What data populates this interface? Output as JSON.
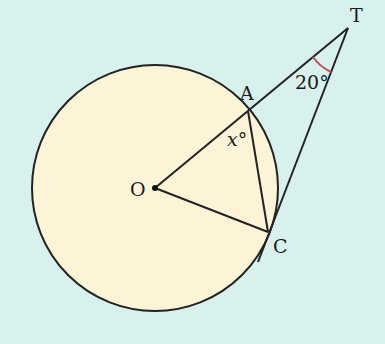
{
  "diagram": {
    "type": "circle-tangent-geometry",
    "colors": {
      "background": "#d8f1ee",
      "circle_fill": "#fdf3d6",
      "stroke": "#222222",
      "angle_arc": "#c0505a"
    },
    "circle": {
      "center_label": "O",
      "cx": 155,
      "cy": 188,
      "r": 123
    },
    "points": {
      "O": {
        "label": "O",
        "x": 155,
        "y": 188
      },
      "A": {
        "label": "A",
        "x": 248,
        "y": 111
      },
      "C": {
        "label": "C",
        "x": 268,
        "y": 232
      },
      "T": {
        "label": "T",
        "x": 348,
        "y": 28
      }
    },
    "segments": [
      "O-T",
      "O-C",
      "A-C",
      "C-T"
    ],
    "angles": {
      "T": {
        "label": "20°",
        "value": 20
      },
      "OAC": {
        "label": "x°",
        "var": "x"
      }
    },
    "labels": {
      "O": "O",
      "A": "A",
      "C": "C",
      "T": "T",
      "angle_T": "20°",
      "angle_x_var": "x",
      "angle_x_deg": "°"
    }
  }
}
